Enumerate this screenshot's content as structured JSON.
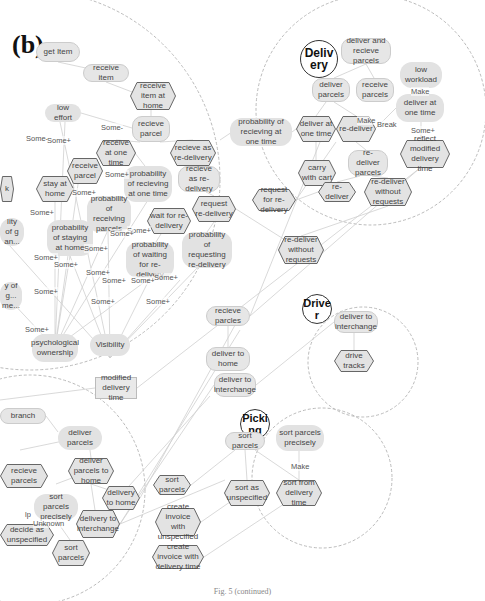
{
  "figure": {
    "panel_label": "(b)",
    "caption": "Fig. 5 (continued)"
  },
  "boundaries": {
    "delivery": {
      "actor": "Deliv ery",
      "cx": 371,
      "cy": 110,
      "r": 115
    },
    "driver": {
      "actor": "Drive r",
      "cx": 363,
      "cy": 362,
      "r": 55
    },
    "picking": {
      "actor": "Picki ng",
      "cx": 322,
      "cy": 478,
      "r": 70
    },
    "left_upper": {
      "cx": 30,
      "cy": 180,
      "r": 190
    },
    "left_lower": {
      "cx": 30,
      "cy": 490,
      "r": 115
    }
  },
  "nodes": [
    {
      "id": "get_item",
      "label": "get Item",
      "shape": "round",
      "x": 36,
      "y": 42,
      "w": 44,
      "h": 20
    },
    {
      "id": "receive_item",
      "label": "receive item",
      "shape": "round",
      "x": 83,
      "y": 64,
      "w": 46,
      "h": 18
    },
    {
      "id": "receive_item_home",
      "label": "receive item at home",
      "shape": "hex",
      "x": 130,
      "y": 82,
      "w": 46,
      "h": 28
    },
    {
      "id": "low_effort",
      "label": "low effort",
      "shape": "cloud",
      "x": 45,
      "y": 104,
      "w": 36,
      "h": 18
    },
    {
      "id": "receive_parcel_1",
      "label": "recieve parcel",
      "shape": "round",
      "x": 132,
      "y": 116,
      "w": 38,
      "h": 26
    },
    {
      "id": "receive_one_time",
      "label": "receive at one time",
      "shape": "hex",
      "x": 96,
      "y": 140,
      "w": 40,
      "h": 26
    },
    {
      "id": "recieve_redelivery_hex",
      "label": "recieve as re-delivery",
      "shape": "hex",
      "x": 170,
      "y": 140,
      "w": 46,
      "h": 26
    },
    {
      "id": "receive_parcel_2",
      "label": "receive parcel",
      "shape": "hex",
      "x": 67,
      "y": 158,
      "w": 36,
      "h": 26
    },
    {
      "id": "stay_home",
      "label": "stay at home",
      "shape": "hex",
      "x": 36,
      "y": 176,
      "w": 38,
      "h": 26
    },
    {
      "id": "prob_receiving_one_time",
      "label": "probability of recieving at one time",
      "shape": "cloud",
      "x": 124,
      "y": 166,
      "w": 48,
      "h": 36
    },
    {
      "id": "recieve_redelivery_round",
      "label": "recieve as re-delivery",
      "shape": "round",
      "x": 178,
      "y": 166,
      "w": 42,
      "h": 26
    },
    {
      "id": "prob_receiving_parcels",
      "label": "probability of receiving parcels",
      "shape": "cloud",
      "x": 87,
      "y": 196,
      "w": 44,
      "h": 36
    },
    {
      "id": "request_redelivery",
      "label": "request re-delivery",
      "shape": "hex",
      "x": 192,
      "y": 196,
      "w": 44,
      "h": 26
    },
    {
      "id": "wait_redelivery",
      "label": "wait for re-delivery",
      "shape": "hex",
      "x": 147,
      "y": 208,
      "w": 44,
      "h": 26
    },
    {
      "id": "prob_staying_home",
      "label": "probability of staying at home",
      "shape": "cloud",
      "x": 47,
      "y": 220,
      "w": 46,
      "h": 36
    },
    {
      "id": "prob_requesting_redelivery",
      "label": "probability of requesting re-delivery",
      "shape": "cloud",
      "x": 182,
      "y": 232,
      "w": 50,
      "h": 36
    },
    {
      "id": "prob_waiting_redelivery",
      "label": "probability of waiting for re-delivery",
      "shape": "cloud",
      "x": 126,
      "y": 242,
      "w": 48,
      "h": 36
    },
    {
      "id": "left_cut_1",
      "label": "lity of g an...",
      "shape": "cloud",
      "x": 0,
      "y": 218,
      "w": 24,
      "h": 28
    },
    {
      "id": "left_cut_2",
      "label": "y of g... me...",
      "shape": "cloud",
      "x": 0,
      "y": 282,
      "w": 22,
      "h": 28
    },
    {
      "id": "left_cut_k",
      "label": "k",
      "shape": "hex",
      "x": 0,
      "y": 176,
      "w": 14,
      "h": 26
    },
    {
      "id": "psych_ownership",
      "label": "psychological ownership",
      "shape": "cloud",
      "x": 32,
      "y": 334,
      "w": 46,
      "h": 28
    },
    {
      "id": "visibility",
      "label": "Visibility",
      "shape": "cloud",
      "x": 90,
      "y": 334,
      "w": 40,
      "h": 22
    },
    {
      "id": "prob_recieving_one_time_mid",
      "label": "probability of recieving at one time",
      "shape": "cloud",
      "x": 230,
      "y": 118,
      "w": 62,
      "h": 28
    },
    {
      "id": "deliver_and_recieve",
      "label": "deliver and recieve parcels",
      "shape": "round",
      "x": 341,
      "y": 38,
      "w": 50,
      "h": 26
    },
    {
      "id": "deliver_parcels_top",
      "label": "deliver parcels",
      "shape": "round",
      "x": 312,
      "y": 78,
      "w": 38,
      "h": 24
    },
    {
      "id": "receive_parcels_top",
      "label": "receive parcels",
      "shape": "round",
      "x": 356,
      "y": 78,
      "w": 38,
      "h": 24
    },
    {
      "id": "low_workload",
      "label": "low workload",
      "shape": "cloud",
      "x": 400,
      "y": 62,
      "w": 42,
      "h": 26
    },
    {
      "id": "deliver_one_time_cloud",
      "label": "deliver at one time",
      "shape": "cloud",
      "x": 396,
      "y": 94,
      "w": 48,
      "h": 28
    },
    {
      "id": "deliver_one_time_hex",
      "label": "deliver at one time",
      "shape": "hex",
      "x": 296,
      "y": 116,
      "w": 40,
      "h": 26
    },
    {
      "id": "re_deliver_hex",
      "label": "re-deliver",
      "shape": "hex",
      "x": 336,
      "y": 116,
      "w": 40,
      "h": 26
    },
    {
      "id": "reflect_modified",
      "label": "reflect modified delivery time",
      "shape": "hex",
      "x": 400,
      "y": 140,
      "w": 50,
      "h": 28
    },
    {
      "id": "carry_cart",
      "label": "carry with cart",
      "shape": "hex",
      "x": 298,
      "y": 160,
      "w": 38,
      "h": 26
    },
    {
      "id": "redeliver_parcels",
      "label": "re-deliver parcels",
      "shape": "round",
      "x": 348,
      "y": 150,
      "w": 40,
      "h": 26
    },
    {
      "id": "redeliver_hex2",
      "label": "re-deliver",
      "shape": "hex",
      "x": 318,
      "y": 182,
      "w": 38,
      "h": 20
    },
    {
      "id": "redeliver_without_inner",
      "label": "re-deliver without requests",
      "shape": "hex",
      "x": 364,
      "y": 178,
      "w": 48,
      "h": 28
    },
    {
      "id": "request_for_redelivery",
      "label": "request for re-delivery",
      "shape": "hex",
      "x": 252,
      "y": 189,
      "w": 44,
      "h": 22
    },
    {
      "id": "redeliver_without_outer",
      "label": "re-deliver without requests",
      "shape": "hex",
      "x": 278,
      "y": 236,
      "w": 46,
      "h": 28
    },
    {
      "id": "recieve_parcles",
      "label": "recieve parcles",
      "shape": "round",
      "x": 206,
      "y": 306,
      "w": 44,
      "h": 20
    },
    {
      "id": "deliver_to_home",
      "label": "deliver to home",
      "shape": "round",
      "x": 206,
      "y": 347,
      "w": 44,
      "h": 24
    },
    {
      "id": "deliver_to_interchange_mid",
      "label": "deliver to interchange",
      "shape": "round",
      "x": 214,
      "y": 373,
      "w": 42,
      "h": 24
    },
    {
      "id": "deliver_to_interchange_driver",
      "label": "deliver to interchange",
      "shape": "round",
      "x": 334,
      "y": 311,
      "w": 44,
      "h": 22
    },
    {
      "id": "drive_tracks",
      "label": "drive tracks",
      "shape": "hex",
      "x": 334,
      "y": 350,
      "w": 40,
      "h": 22
    },
    {
      "id": "modified_delivery_time",
      "label": "modified delivery time",
      "shape": "rect",
      "x": 95,
      "y": 377,
      "w": 42,
      "h": 22
    },
    {
      "id": "branch",
      "label": "branch",
      "shape": "round",
      "x": 0,
      "y": 408,
      "w": 46,
      "h": 16
    },
    {
      "id": "deliver_parcels_low",
      "label": "deliver parcels",
      "shape": "cloud",
      "x": 58,
      "y": 426,
      "w": 44,
      "h": 24
    },
    {
      "id": "deliver_parcels_home",
      "label": "deliver parcels to home",
      "shape": "hex",
      "x": 68,
      "y": 458,
      "w": 46,
      "h": 26
    },
    {
      "id": "recieve_parcels_cut",
      "label": "recieve parcels",
      "shape": "hex",
      "x": 0,
      "y": 464,
      "w": 48,
      "h": 24
    },
    {
      "id": "delivery_to_home",
      "label": "delivery to home",
      "shape": "hex",
      "x": 102,
      "y": 486,
      "w": 38,
      "h": 24
    },
    {
      "id": "sort_parcels_precisely_low",
      "label": "sort parcels precisely",
      "shape": "cloud",
      "x": 34,
      "y": 494,
      "w": 44,
      "h": 26
    },
    {
      "id": "delivery_to_interchange",
      "label": "delivery to interchange",
      "shape": "hex",
      "x": 76,
      "y": 510,
      "w": 44,
      "h": 28
    },
    {
      "id": "decide_unspecified",
      "label": "decide as unspecified",
      "shape": "hex",
      "x": 0,
      "y": 524,
      "w": 54,
      "h": 22
    },
    {
      "id": "sort_parcels_low",
      "label": "sort parcels",
      "shape": "hex",
      "x": 52,
      "y": 540,
      "w": 38,
      "h": 26
    },
    {
      "id": "sort_parcels_mid",
      "label": "sort parcels",
      "shape": "hex",
      "x": 153,
      "y": 475,
      "w": 38,
      "h": 20
    },
    {
      "id": "create_invoice_unspecified",
      "label": "create invoice with unspecified",
      "shape": "hex",
      "x": 155,
      "y": 508,
      "w": 46,
      "h": 28
    },
    {
      "id": "create_invoice_delivery_time",
      "label": "create invoice with delivery time",
      "shape": "hex",
      "x": 152,
      "y": 545,
      "w": 52,
      "h": 24
    },
    {
      "id": "sort_parcels_pick",
      "label": "sort parcels",
      "shape": "round",
      "x": 225,
      "y": 432,
      "w": 40,
      "h": 18
    },
    {
      "id": "sort_parcels_precisely_pick",
      "label": "sort parcels precisely",
      "shape": "cloud",
      "x": 276,
      "y": 425,
      "w": 48,
      "h": 26
    },
    {
      "id": "sort_unspecified",
      "label": "sort as unspecified",
      "shape": "hex",
      "x": 224,
      "y": 480,
      "w": 46,
      "h": 26
    },
    {
      "id": "sort_delivery_time",
      "label": "sort from delivery time",
      "shape": "hex",
      "x": 276,
      "y": 480,
      "w": 46,
      "h": 26
    }
  ],
  "edge_labels": [
    {
      "text": "Some-",
      "x": 101,
      "y": 123
    },
    {
      "text": "Some-",
      "x": 26,
      "y": 134
    },
    {
      "text": "Some+",
      "x": 47,
      "y": 136
    },
    {
      "text": "Some+",
      "x": 105,
      "y": 170
    },
    {
      "text": "Some+",
      "x": 72,
      "y": 188
    },
    {
      "text": "Some+",
      "x": 30,
      "y": 208
    },
    {
      "text": "Some+",
      "x": 127,
      "y": 226
    },
    {
      "text": "Some+",
      "x": 110,
      "y": 229
    },
    {
      "text": "Some+",
      "x": 84,
      "y": 244
    },
    {
      "text": "Some+",
      "x": 34,
      "y": 253
    },
    {
      "text": "Some+",
      "x": 54,
      "y": 260
    },
    {
      "text": "Some+",
      "x": 86,
      "y": 268
    },
    {
      "text": "Some+",
      "x": 102,
      "y": 276
    },
    {
      "text": "Some+",
      "x": 131,
      "y": 276
    },
    {
      "text": "Some+",
      "x": 154,
      "y": 273
    },
    {
      "text": "Some+",
      "x": 34,
      "y": 287
    },
    {
      "text": "Some+",
      "x": 91,
      "y": 297
    },
    {
      "text": "Some+",
      "x": 146,
      "y": 297
    },
    {
      "text": "Some+",
      "x": 25,
      "y": 325
    },
    {
      "text": "Make",
      "x": 357,
      "y": 116
    },
    {
      "text": "Break",
      "x": 377,
      "y": 120
    },
    {
      "text": "Make",
      "x": 411,
      "y": 87
    },
    {
      "text": "Some+",
      "x": 411,
      "y": 126
    },
    {
      "text": "Make",
      "x": 291,
      "y": 462
    },
    {
      "text": "Unknown",
      "x": 33,
      "y": 519
    },
    {
      "text": "lp",
      "x": 25,
      "y": 510
    }
  ]
}
